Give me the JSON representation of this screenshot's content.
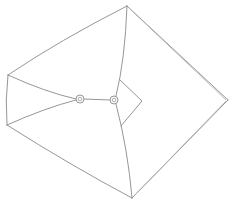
{
  "figure": {
    "type": "line-drawing",
    "stroke_color": "#8a8a8a",
    "background": "#ffffff",
    "fasteners": [
      {
        "name": "fastener-left",
        "cx": 80,
        "cy": 99,
        "r": 4
      },
      {
        "name": "fastener-right",
        "cx": 114,
        "cy": 100,
        "r": 4
      }
    ]
  }
}
